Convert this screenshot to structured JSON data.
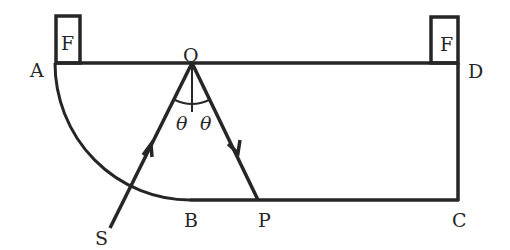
{
  "diagram": {
    "type": "optics-ray-diagram",
    "points": {
      "A": "A",
      "B": "B",
      "C": "C",
      "D": "D",
      "O": "O",
      "P": "P",
      "S": "S"
    },
    "blocks": {
      "left": "F",
      "right": "F"
    },
    "angles": {
      "left": "θ",
      "right": "θ"
    },
    "colors": {
      "stroke": "#262626",
      "background": "#ffffff"
    }
  }
}
